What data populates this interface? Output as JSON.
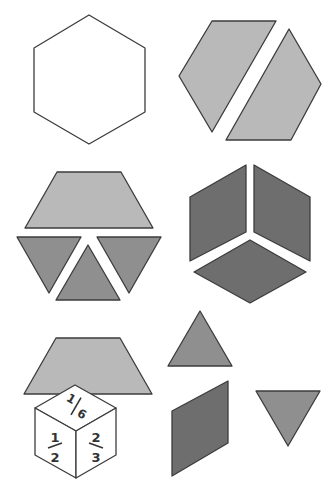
{
  "colors": {
    "outline": "#3c3c3c",
    "hexagon_fill": "#ffffff",
    "trapezoid_fill": "#b9b9b9",
    "triangle_fill": "#8f8f8f",
    "rhombus_fill": "#6e6e6e",
    "cube_fill": "#ffffff"
  },
  "shapes": {
    "hexagon": "hexagon",
    "trapezoids_pair": "two-trapezoids-forming-hexagon",
    "trapezoid_triangles": "trapezoid-and-three-triangles",
    "rhombus_cube": "three-rhombi-forming-hexagon",
    "single_trapezoid": "trapezoid",
    "single_triangle_up": "triangle",
    "single_triangle_down": "triangle",
    "single_rhombus": "rhombus"
  },
  "fraction_cube": {
    "top": {
      "numerator": "1",
      "denominator": "6"
    },
    "left": {
      "numerator": "1",
      "denominator": "2"
    },
    "right": {
      "numerator": "2",
      "denominator": "3"
    }
  }
}
